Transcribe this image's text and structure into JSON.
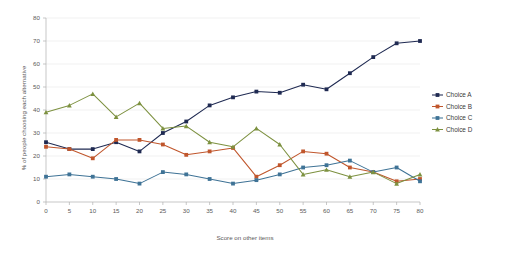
{
  "chart_data": {
    "type": "line",
    "title": "",
    "xlabel": "Score on other items",
    "ylabel": "% of people choosing each alternative",
    "xlim": [
      0,
      80
    ],
    "ylim": [
      0,
      80
    ],
    "grid": true,
    "legend_position": "right",
    "x": [
      0,
      5,
      10,
      15,
      20,
      25,
      30,
      35,
      40,
      45,
      50,
      55,
      60,
      65,
      70,
      75,
      80
    ],
    "xticks": [
      "0",
      "5",
      "10",
      "15",
      "20",
      "25",
      "30",
      "35",
      "40",
      "45",
      "50",
      "55",
      "60",
      "65",
      "70",
      "75",
      "80"
    ],
    "yticks": [
      "0",
      "10",
      "20",
      "30",
      "40",
      "50",
      "60",
      "70",
      "80"
    ],
    "series": [
      {
        "name": "Choice A",
        "color": "#1f2a52",
        "marker": "square",
        "values": [
          26,
          23,
          23,
          26,
          22,
          30,
          35,
          42,
          45.5,
          48,
          47.5,
          51,
          49,
          56,
          63,
          69,
          70
        ]
      },
      {
        "name": "Choice B",
        "color": "#c0562c",
        "marker": "square",
        "values": [
          24,
          23,
          19,
          27,
          27,
          25,
          20.5,
          22,
          23.5,
          11,
          16,
          22,
          21,
          15,
          13,
          9,
          10
        ]
      },
      {
        "name": "Choice C",
        "color": "#3f7396",
        "marker": "square",
        "values": [
          11,
          12,
          11,
          10,
          8,
          13,
          12,
          10,
          8,
          9.5,
          12,
          15,
          16,
          18,
          13,
          15,
          9
        ]
      },
      {
        "name": "Choice D",
        "color": "#7d9140",
        "marker": "triangle",
        "values": [
          39,
          42,
          47,
          37,
          43,
          32,
          33,
          26,
          24,
          32,
          25,
          12,
          14,
          11,
          13,
          8,
          12
        ]
      }
    ]
  }
}
